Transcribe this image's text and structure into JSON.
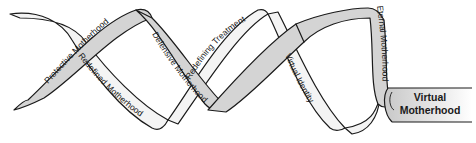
{
  "diagram": {
    "type": "helix-ribbon",
    "colors": {
      "ribbon_front": "#d4d4d4",
      "ribbon_back": "#f4f4f4",
      "outline": "#1a1a1a",
      "background": "#ffffff"
    },
    "strands": [
      {
        "id": "protective",
        "label": "Protective Motherhood",
        "shade": "gray"
      },
      {
        "id": "redefined",
        "label": "Redefined Motherhood",
        "shade": "light"
      },
      {
        "id": "defensive",
        "label": "Defensive Motherhood",
        "shade": "gray"
      },
      {
        "id": "redefining-treatment",
        "label": "Redefining Treatment",
        "shade": "light"
      },
      {
        "id": "virtual-identity",
        "label": "Virtual Identity",
        "shade": "light"
      },
      {
        "id": "eternal",
        "label": "Eternal Motherhood",
        "shade": "gray"
      }
    ],
    "end_label": {
      "line1": "Virtual",
      "line2": "Motherhood"
    }
  }
}
